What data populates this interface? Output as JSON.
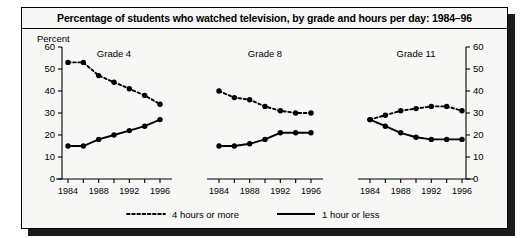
{
  "figure": {
    "title": "Percentage of students who watched television, by grade and hours per day: 1984–96",
    "y_axis_title": "Percent"
  },
  "legend": {
    "items": [
      {
        "label": "4 hours or more",
        "style": "dotted",
        "color": "#000000"
      },
      {
        "label": "1 hour or less",
        "style": "solid",
        "color": "#000000"
      }
    ]
  },
  "chart_data": {
    "type": "line",
    "title": "Percentage of students who watched television, by grade and hours per day: 1984–96",
    "xlabel": "",
    "ylabel": "Percent",
    "ylim": [
      0,
      60
    ],
    "yticks": [
      0,
      10,
      20,
      30,
      40,
      50,
      60
    ],
    "ytick_labels": [
      "0",
      "10",
      "20",
      "30",
      "40",
      "50",
      "60"
    ],
    "right_axis_ticks": [
      0,
      10,
      20,
      30,
      40,
      50,
      60
    ],
    "right_axis_tick_labels": [
      "0",
      "10",
      "20",
      "30",
      "40",
      "50",
      "60"
    ],
    "grid": false,
    "legend_position": "bottom",
    "x": [
      1984,
      1986,
      1988,
      1990,
      1992,
      1994,
      1996
    ],
    "xtick_labels": [
      "1984",
      "",
      "1988",
      "",
      "1992",
      "",
      "1996"
    ],
    "panels": [
      {
        "name": "Grade 4",
        "series": [
          {
            "name": "4 hours or more",
            "style": "dotted",
            "values": [
              53,
              53,
              47,
              44,
              41,
              38,
              34
            ]
          },
          {
            "name": "1 hour or less",
            "style": "solid",
            "values": [
              15,
              15,
              18,
              20,
              22,
              24,
              27
            ]
          }
        ]
      },
      {
        "name": "Grade 8",
        "series": [
          {
            "name": "4 hours or more",
            "style": "dotted",
            "values": [
              40,
              37,
              36,
              33,
              31,
              30,
              30
            ]
          },
          {
            "name": "1 hour or less",
            "style": "solid",
            "values": [
              15,
              15,
              16,
              18,
              21,
              21,
              21
            ]
          }
        ]
      },
      {
        "name": "Grade 11",
        "series": [
          {
            "name": "4 hours or more",
            "style": "dotted",
            "values": [
              27,
              29,
              31,
              32,
              33,
              33,
              31
            ]
          },
          {
            "name": "1 hour or less",
            "style": "solid",
            "values": [
              27,
              24,
              21,
              19,
              18,
              18,
              18
            ]
          }
        ]
      }
    ]
  }
}
